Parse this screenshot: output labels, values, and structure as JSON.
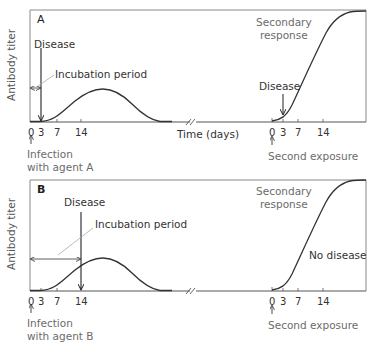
{
  "diagram": {
    "x_axis_label": "Time (days)",
    "y_axis_label": "Antibody titer",
    "panels": [
      {
        "id": "A",
        "letter": "A",
        "primary_ticks": [
          "0",
          "3",
          "7",
          "14"
        ],
        "secondary_ticks": [
          "0",
          "3",
          "7",
          "14"
        ],
        "disease_label": "Disease",
        "incubation_label": "Incubation period",
        "infection_label_line1": "Infection",
        "infection_label_line2": "with agent A",
        "secondary_response_line1": "Secondary",
        "secondary_response_line2": "response",
        "secondary_disease_label": "Disease",
        "second_exposure_label": "Second exposure",
        "incubation_days": 3,
        "disease_on_second_exposure": true
      },
      {
        "id": "B",
        "letter": "B",
        "primary_ticks": [
          "0",
          "3",
          "7",
          "14"
        ],
        "secondary_ticks": [
          "0",
          "3",
          "7",
          "14"
        ],
        "disease_label": "Disease",
        "incubation_label": "Incubation period",
        "infection_label_line1": "Infection",
        "infection_label_line2": "with agent B",
        "secondary_response_line1": "Secondary",
        "secondary_response_line2": "response",
        "no_disease_label": "No disease",
        "second_exposure_label": "Second exposure",
        "incubation_days": 14,
        "disease_on_second_exposure": false
      }
    ],
    "colors": {
      "curve": "#333333",
      "frame": "#777777",
      "leader_line": "#aaaaaa",
      "text": "#333333",
      "grey_text": "#6b6b6b"
    }
  }
}
